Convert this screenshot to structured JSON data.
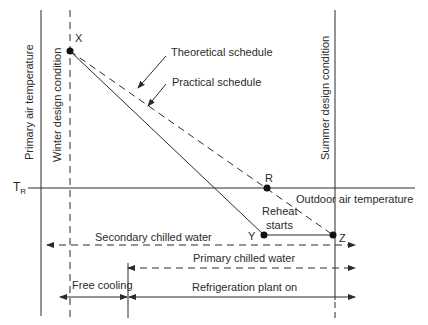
{
  "diagram": {
    "axis_labels": {
      "y_axis": "Primary air temperature",
      "winter": "Winter design condition",
      "summer": "Summer design condition",
      "tr": "T",
      "tr_sub": "R",
      "outdoor": "Outdoor air temperature"
    },
    "points": {
      "x": "X",
      "r": "R",
      "y": "Y",
      "z": "Z"
    },
    "callouts": {
      "theoretical": "Theoretical schedule",
      "practical": "Practical schedule",
      "reheat_line1": "Reheat",
      "reheat_line2": "starts"
    },
    "ranges": {
      "secondary": "Secondary chilled water",
      "primary": "Primary chilled water",
      "free_cooling": "Free cooling",
      "refrigeration": "Refrigeration plant on"
    },
    "colors": {
      "line": "#2b2b2b",
      "background": "#ffffff"
    }
  }
}
